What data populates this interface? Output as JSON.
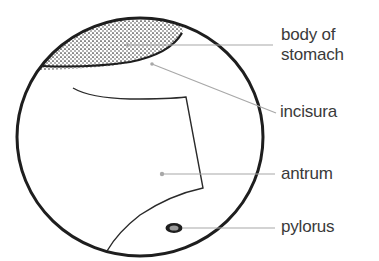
{
  "diagram": {
    "colors": {
      "outline": "#1e1e1e",
      "leader": "#a8a8a8",
      "text": "#3a3a3a",
      "stipple": "#2a2a2a"
    },
    "labels": [
      {
        "id": "body",
        "line1": "body of",
        "line2": "stomach"
      },
      {
        "id": "incisura",
        "line1": "incisura"
      },
      {
        "id": "antrum",
        "line1": "antrum"
      },
      {
        "id": "pylorus",
        "line1": "pylorus"
      }
    ]
  }
}
